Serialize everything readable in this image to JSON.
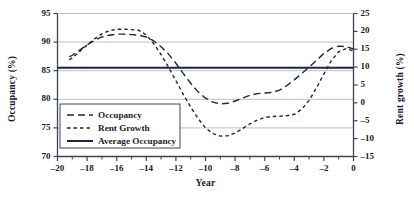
{
  "chart_data": {
    "type": "line",
    "title": "",
    "xlabel": "Year",
    "ylabel": "Occupancy (%)",
    "y2label": "Rent growth (%)",
    "xlim": [
      -20,
      0
    ],
    "ylim": [
      70,
      95
    ],
    "y2lim": [
      -15,
      25
    ],
    "grid": true,
    "legend_position": "lower-left-inside",
    "x_ticks": [
      -20,
      -18,
      -16,
      -14,
      -12,
      -10,
      -8,
      -6,
      -4,
      -2,
      0
    ],
    "x_tick_labels": [
      "–20",
      "–18",
      "–16",
      "–14",
      "–12",
      "–10",
      "–8",
      "–6",
      "–4",
      "–2",
      "0"
    ],
    "x_minor_tick_step": 1,
    "y_ticks": [
      70,
      75,
      80,
      85,
      90,
      95
    ],
    "y_tick_labels": [
      "70",
      "75",
      "80",
      "85",
      "90",
      "95"
    ],
    "y2_ticks": [
      -15,
      -10,
      -5,
      0,
      5,
      10,
      15,
      20,
      25
    ],
    "y2_tick_labels": [
      "–15",
      "–10",
      "–5",
      "0",
      "5",
      "10",
      "15",
      "20",
      "25"
    ],
    "series": [
      {
        "name": "Occupancy",
        "axis": "left",
        "style": "long-dash",
        "color": "#1b2642",
        "x": [
          -19.2,
          -19,
          -18.5,
          -18,
          -17.5,
          -17,
          -16.5,
          -16,
          -15.5,
          -15,
          -14.5,
          -14,
          -13.5,
          -13,
          -12.5,
          -12,
          -11.5,
          -11,
          -10.5,
          -10,
          -9.5,
          -9,
          -8.5,
          -8,
          -7.5,
          -7,
          -6.5,
          -6,
          -5.5,
          -5,
          -4.5,
          -4,
          -3.5,
          -3,
          -2.5,
          -2,
          -1.5,
          -1,
          -0.5,
          0
        ],
        "y": [
          87.4,
          87.7,
          88.6,
          89.5,
          90.3,
          90.9,
          91.2,
          91.4,
          91.4,
          91.3,
          91.2,
          90.9,
          90.2,
          89.2,
          87.9,
          86.3,
          84.5,
          82.8,
          81.3,
          80.2,
          79.5,
          79.2,
          79.3,
          79.7,
          80.2,
          80.7,
          81.0,
          81.1,
          81.2,
          81.6,
          82.4,
          83.4,
          84.5,
          85.6,
          86.8,
          88.0,
          88.9,
          89.3,
          89.2,
          88.8
        ]
      },
      {
        "name": "Rent Growth",
        "axis": "right",
        "style": "short-dash",
        "color": "#1b2642",
        "x": [
          -19.2,
          -19,
          -18.5,
          -18,
          -17.5,
          -17,
          -16.5,
          -16,
          -15.5,
          -15,
          -14.5,
          -14,
          -13.5,
          -13,
          -12.5,
          -12,
          -11.5,
          -11,
          -10.5,
          -10,
          -9.5,
          -9,
          -8.5,
          -8,
          -7.5,
          -7,
          -6.5,
          -6,
          -5.5,
          -5,
          -4.5,
          -4,
          -3.5,
          -3,
          -2.5,
          -2,
          -1.5,
          -1,
          -0.5,
          0
        ],
        "y": [
          12.0,
          12.6,
          14.4,
          16.2,
          17.9,
          19.3,
          20.2,
          20.6,
          20.6,
          20.5,
          20.3,
          19.0,
          16.6,
          13.5,
          10.0,
          6.2,
          2.4,
          -1.2,
          -4.4,
          -7.0,
          -8.6,
          -9.3,
          -9.2,
          -8.4,
          -7.2,
          -5.9,
          -4.8,
          -4.1,
          -3.8,
          -3.7,
          -3.6,
          -3.2,
          -1.8,
          0.7,
          4.2,
          8.1,
          11.8,
          14.3,
          15.2,
          14.5
        ]
      },
      {
        "name": "Average Occupancy",
        "axis": "left",
        "style": "solid",
        "color": "#1b2642",
        "constant_value": 85.5
      }
    ],
    "legend": [
      {
        "label": "Occupancy",
        "style": "long-dash"
      },
      {
        "label": "Rent Growth",
        "style": "short-dash"
      },
      {
        "label": "Average Occupancy",
        "style": "solid"
      }
    ]
  },
  "colors": {
    "line": "#1b2642",
    "grid": "#b9bfcc",
    "axis": "#3c4456",
    "text": "#151b2c",
    "background": "#ffffff"
  }
}
